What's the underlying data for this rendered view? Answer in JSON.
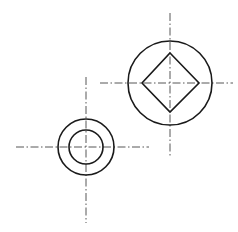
{
  "diagram": {
    "type": "technical-drawing",
    "background": "#ffffff",
    "line_color": "#1a1a1a",
    "centerline_color": "#444444",
    "features": [
      {
        "name": "large-circle-with-square",
        "center": [
          170,
          83
        ],
        "outer_circle_radius": 42,
        "diamond": {
          "top": [
            170,
            53
          ],
          "right": [
            199,
            83
          ],
          "bottom": [
            170,
            112
          ],
          "left": [
            142,
            83
          ]
        },
        "centerlines": {
          "vertical": {
            "x": 170,
            "y1": 13,
            "y2": 158
          },
          "horizontal": {
            "y": 83,
            "x1": 100,
            "x2": 233
          }
        }
      },
      {
        "name": "concentric-circles",
        "center": [
          86,
          147
        ],
        "outer_circle_radius": 28,
        "inner_circle_radius": 17,
        "centerlines": {
          "vertical": {
            "x": 86,
            "y1": 77,
            "y2": 223
          },
          "horizontal": {
            "y": 147,
            "x1": 16,
            "x2": 149
          }
        }
      }
    ]
  }
}
